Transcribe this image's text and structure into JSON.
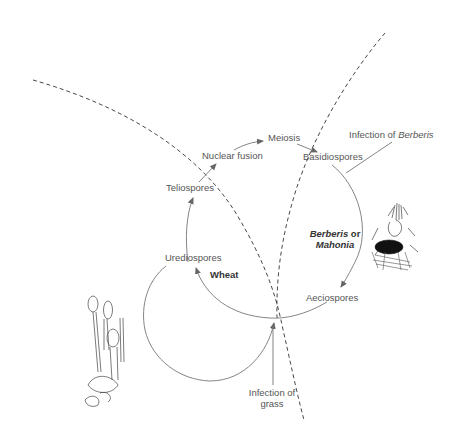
{
  "diagram": {
    "stages": {
      "meiosis": "Meiosis",
      "nuclear_fusion": "Nuclear fusion",
      "basidiospores": "Basidiospores",
      "teliospores": "Teliospores",
      "urediospores": "Urediospores",
      "aeciospores": "Aeciospores"
    },
    "hosts": {
      "wheat": "Wheat",
      "alternate_line1_italic": "Berberis",
      "alternate_line1_rest": " or",
      "alternate_line2_italic": "Mahonia"
    },
    "annotations": {
      "infection_berberis_prefix": "Infection of ",
      "infection_berberis_italic": "Berberis",
      "infection_grass_line1": "Infection of",
      "infection_grass_line2": "grass"
    },
    "illustrations": [
      "teliospore-cluster-drawing",
      "aecial-cup-on-berberis-drawing"
    ],
    "colors": {
      "line": "#777777",
      "text": "#555555",
      "dashed": "#333333"
    }
  }
}
